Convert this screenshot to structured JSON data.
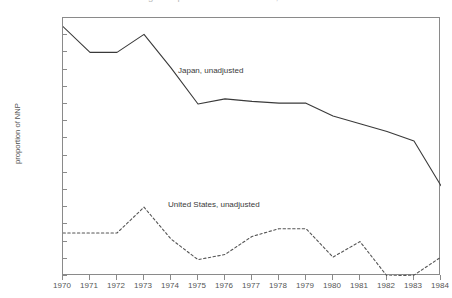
{
  "figure": {
    "title": "Saving in Japan and United States, 1970-1984",
    "title_clipped": true
  },
  "axes": {
    "ylabel": "proportion of NNP",
    "xlabel": "",
    "yticks": [
      "0.32",
      "0.3",
      "0.28",
      "0.26",
      "0.24",
      "0.22",
      "0.2",
      "0.18",
      "0.16",
      "0.14",
      "0.12",
      "0.1",
      "0.08",
      "0.06",
      "0.04",
      "0.02"
    ],
    "xticks": [
      "1970",
      "1971",
      "1972",
      "1973",
      "1974",
      "1975",
      "1976",
      "1977",
      "1978",
      "1979",
      "1980",
      "1981",
      "1982",
      "1983",
      "1984"
    ]
  },
  "annotations": {
    "japan": "Japan, unadjusted",
    "united_states": "United States, unadjusted"
  },
  "colors": {
    "frame": "#8a8a8a",
    "japan_line": "#3a3a3a",
    "us_line": "#555555",
    "text": "#555555"
  },
  "chart_data": {
    "type": "line",
    "title": "Saving in Japan and United States, 1970-1984",
    "xlabel": "",
    "ylabel": "proportion of NNP",
    "xlim": [
      1970,
      1984
    ],
    "ylim": [
      0.02,
      0.32
    ],
    "grid": false,
    "legend": "inline-annotations",
    "x": [
      1970,
      1971,
      1972,
      1973,
      1974,
      1975,
      1976,
      1977,
      1978,
      1979,
      1980,
      1981,
      1982,
      1983,
      1984
    ],
    "series": [
      {
        "name": "Japan, unadjusted",
        "style": "solid",
        "values": [
          0.31,
          0.28,
          0.28,
          0.301,
          0.262,
          0.22,
          0.226,
          0.223,
          0.221,
          0.221,
          0.206,
          0.197,
          0.188,
          0.177,
          0.125
        ]
      },
      {
        "name": "United States, unadjusted",
        "style": "dashed",
        "values": [
          0.07,
          0.07,
          0.07,
          0.1,
          0.063,
          0.039,
          0.045,
          0.066,
          0.075,
          0.075,
          0.042,
          0.06,
          0.02,
          0.021,
          0.042
        ]
      }
    ]
  }
}
